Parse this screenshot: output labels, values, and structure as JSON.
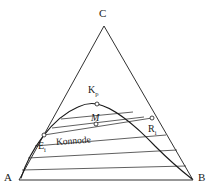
{
  "figure": {
    "kind": "ternary-phase-diagram",
    "width": 211,
    "height": 192,
    "background_color": "#ffffff",
    "line_color": "#1a1a1a",
    "marker_fill": "#ffffff"
  },
  "vertices": {
    "top": {
      "label": "C",
      "x": 104,
      "y": 26
    },
    "bottom_left": {
      "label": "A",
      "x": 19,
      "y": 180
    },
    "bottom_right": {
      "label": "B",
      "x": 193,
      "y": 180
    }
  },
  "points": [
    {
      "id": "kp",
      "label": "K",
      "subscript": "p",
      "x": 97,
      "y": 104,
      "marker": "open-circle"
    },
    {
      "id": "m",
      "label": "M",
      "subscript": "",
      "x": 96,
      "y": 124,
      "marker": "open-circle",
      "italic": true
    },
    {
      "id": "ei",
      "label": "E",
      "subscript": "i",
      "x": 44,
      "y": 135,
      "marker": "open-circle"
    },
    {
      "id": "ri",
      "label": "R",
      "subscript": "i",
      "x": 152,
      "y": 118,
      "marker": "open-circle"
    }
  ],
  "annotations": {
    "tie_line_caption": "Konnode"
  },
  "curve": {
    "name": "binodal-dome",
    "apex": {
      "x": 97,
      "y": 104
    },
    "left_foot": {
      "x": 21,
      "y": 178
    },
    "right_foot": {
      "x": 192,
      "y": 179
    }
  },
  "tie_lines": {
    "count": 6,
    "label": "Konnoden"
  }
}
